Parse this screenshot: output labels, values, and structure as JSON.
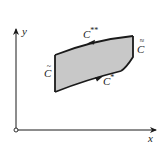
{
  "diagram": {
    "axes": {
      "x_label": "x",
      "y_label": "y",
      "origin_marker": "open-circle"
    },
    "region": {
      "fill_color": "#c8c8c8",
      "stroke_color": "#1a1a1a"
    },
    "curves": {
      "top": {
        "label": "C",
        "superscript": "**",
        "direction": "right-to-left"
      },
      "bottom": {
        "label": "C",
        "superscript": "*",
        "direction": "left-to-right"
      },
      "left": {
        "label": "C",
        "accent": "~"
      },
      "right": {
        "label": "C",
        "accent": "≈"
      }
    }
  }
}
